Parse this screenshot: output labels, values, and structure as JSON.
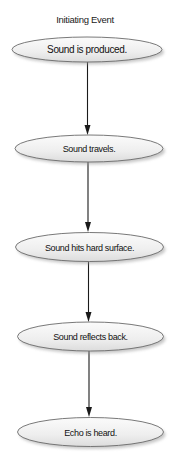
{
  "diagram": {
    "title": "Initiating Event",
    "nodes": [
      {
        "label": "Sound is produced."
      },
      {
        "label": "Sound travels."
      },
      {
        "label": "Sound hits hard surface."
      },
      {
        "label": "Sound reflects back."
      },
      {
        "label": "Echo is heard."
      }
    ],
    "edges": [
      {
        "from": "Sound is produced.",
        "to": "Sound travels."
      },
      {
        "from": "Sound travels.",
        "to": "Sound hits hard surface."
      },
      {
        "from": "Sound hits hard surface.",
        "to": "Sound reflects back."
      },
      {
        "from": "Sound reflects back.",
        "to": "Echo is heard."
      }
    ],
    "colors": {
      "node_fill_light": "#f7f7f7",
      "node_fill_dark": "#e2e2e2",
      "node_stroke": "#6a6a6a",
      "arrow": "#1a1a1a",
      "text": "#111111"
    }
  }
}
